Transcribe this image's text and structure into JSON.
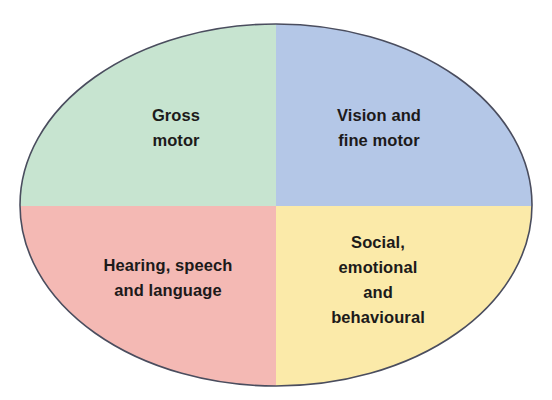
{
  "diagram": {
    "type": "quadrant-ellipse",
    "colors": {
      "top_left": "#c7e4d0",
      "top_right": "#b4c7e7",
      "bottom_left": "#f4b9b4",
      "bottom_right": "#fbeaa9",
      "outline": "#4a4d5e",
      "text": "#1c1a1a"
    },
    "quadrants": [
      {
        "position": "top-left",
        "lines": [
          "Gross",
          "motor"
        ]
      },
      {
        "position": "top-right",
        "lines": [
          "Vision and",
          "fine motor"
        ]
      },
      {
        "position": "bottom-left",
        "lines": [
          "Hearing, speech",
          "and language"
        ]
      },
      {
        "position": "bottom-right",
        "lines": [
          "Social,",
          "emotional",
          "and",
          "behavioural"
        ]
      }
    ]
  }
}
